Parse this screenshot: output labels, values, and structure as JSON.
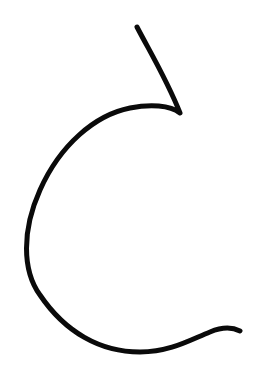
{
  "drawing": {
    "description": "hand-drawn curved arrow stroke",
    "stroke_color": "#0a0a0a",
    "background_color": "#ffffff",
    "stroke_width": 5
  }
}
